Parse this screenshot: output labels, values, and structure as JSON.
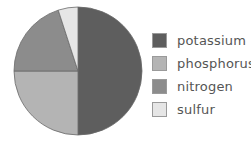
{
  "chart_data": {
    "type": "pie",
    "title": "",
    "categories": [
      "potassium",
      "phosphorus",
      "nitrogen",
      "sulfur"
    ],
    "values": [
      50,
      25,
      20,
      5
    ],
    "unit": "%",
    "start_angle_deg": 0,
    "direction": "clockwise",
    "colors": [
      "#5e5e5e",
      "#b4b4b4",
      "#8c8c8c",
      "#e6e6e6"
    ],
    "legend_position": "right",
    "data_labels": false
  },
  "legend": {
    "items": [
      {
        "label": "potassium",
        "color": "#5e5e5e"
      },
      {
        "label": "phosphorus",
        "color": "#b4b4b4"
      },
      {
        "label": "nitrogen",
        "color": "#8c8c8c"
      },
      {
        "label": "sulfur",
        "color": "#e6e6e6"
      }
    ]
  }
}
